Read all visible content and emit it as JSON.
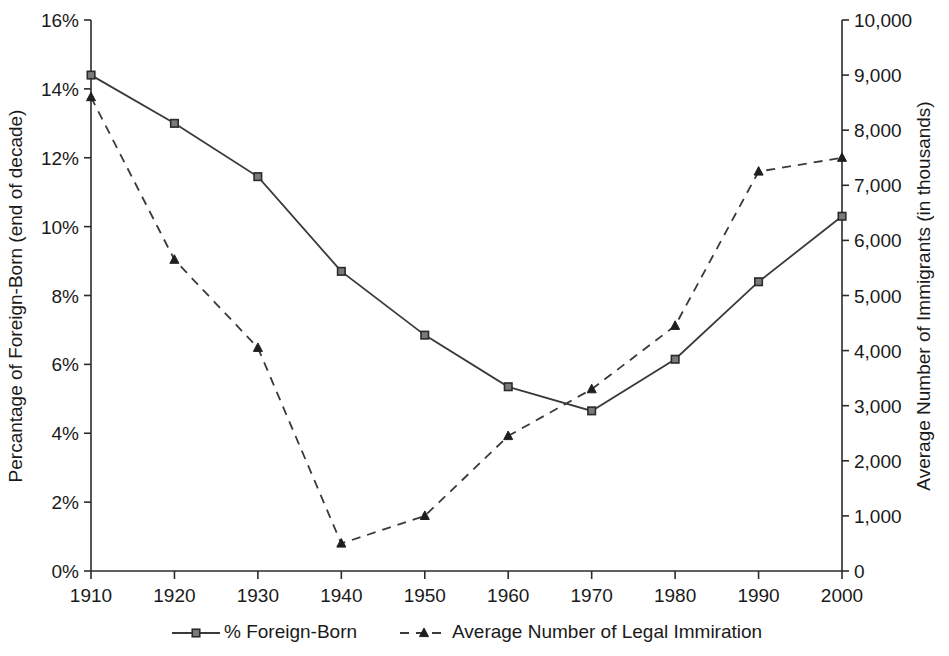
{
  "chart_data": {
    "type": "line",
    "title": "",
    "subtitle": "",
    "xlabel": "",
    "categories": [
      "1910",
      "1920",
      "1930",
      "1940",
      "1950",
      "1960",
      "1970",
      "1980",
      "1990",
      "2000"
    ],
    "x": [
      1910,
      1920,
      1930,
      1940,
      1950,
      1960,
      1970,
      1980,
      1990,
      2000
    ],
    "grid": false,
    "legend_position": "bottom",
    "axes": {
      "left": {
        "label": "Percantage of Foreign-Born (end of decade)",
        "ticks": [
          "0%",
          "2%",
          "4%",
          "6%",
          "8%",
          "10%",
          "12%",
          "14%",
          "16%"
        ],
        "tick_values": [
          0,
          2,
          4,
          6,
          8,
          10,
          12,
          14,
          16
        ],
        "ylim": [
          0,
          16
        ],
        "unit": "%"
      },
      "right": {
        "label": "Average Number of Immigrants (in thousands)",
        "ticks": [
          "0",
          "1,000",
          "2,000",
          "3,000",
          "4,000",
          "5,000",
          "6,000",
          "7,000",
          "8,000",
          "9,000",
          "10,000"
        ],
        "tick_values": [
          0,
          1000,
          2000,
          3000,
          4000,
          5000,
          6000,
          7000,
          8000,
          9000,
          10000
        ],
        "ylim": [
          0,
          10000
        ],
        "unit": "thousands"
      },
      "bottom": {
        "label": "",
        "ticks": [
          "1910",
          "1920",
          "1930",
          "1940",
          "1950",
          "1960",
          "1970",
          "1980",
          "1990",
          "2000"
        ]
      }
    },
    "series": [
      {
        "name": "% Foreign-Born",
        "axis": "left",
        "marker": "square",
        "line_style": "solid",
        "color": "#3a3a3a",
        "marker_fill": "#7a7a7a",
        "values": [
          14.4,
          13.0,
          11.45,
          8.7,
          6.85,
          5.35,
          4.65,
          6.15,
          8.4,
          10.3
        ]
      },
      {
        "name": "Average Number of Legal Immiration",
        "axis": "right",
        "marker": "triangle",
        "line_style": "dashed",
        "color": "#3a3a3a",
        "marker_fill": "#1f1f1f",
        "values": [
          8600,
          5650,
          4050,
          500,
          1000,
          2450,
          3300,
          4450,
          7250,
          7500
        ]
      }
    ],
    "legend": [
      {
        "label": "% Foreign-Born",
        "marker": "square",
        "line_style": "solid"
      },
      {
        "label": "Average Number of Legal Immiration",
        "marker": "triangle",
        "line_style": "dashed"
      }
    ]
  }
}
